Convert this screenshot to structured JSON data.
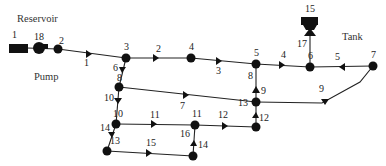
{
  "diagram": {
    "title_labels": {
      "reservoir": "Reservoir",
      "pump": "Pump",
      "tank": "Tank"
    },
    "nodes": [
      {
        "id": "1",
        "type": "reservoir",
        "x": 18,
        "y": 48,
        "label": "1",
        "lx": 12,
        "ly": 38
      },
      {
        "id": "18",
        "type": "pump",
        "x": 39,
        "y": 48,
        "label": "18",
        "lx": 34,
        "ly": 40
      },
      {
        "id": "2",
        "type": "junction",
        "x": 58,
        "y": 49,
        "label": "2",
        "lx": 59,
        "ly": 44
      },
      {
        "id": "3",
        "type": "junction",
        "x": 126,
        "y": 58,
        "label": "3",
        "lx": 124,
        "ly": 48
      },
      {
        "id": "4",
        "type": "junction",
        "x": 191,
        "y": 58,
        "label": "4",
        "lx": 189,
        "ly": 48
      },
      {
        "id": "5",
        "type": "junction",
        "x": 256,
        "y": 64,
        "label": "5",
        "lx": 254,
        "ly": 55
      },
      {
        "id": "6",
        "type": "junction",
        "x": 310,
        "y": 67,
        "label": "6",
        "lx": 308,
        "ly": 59
      },
      {
        "id": "7",
        "type": "junction",
        "x": 373,
        "y": 66,
        "label": "7",
        "lx": 371,
        "ly": 58
      },
      {
        "id": "8",
        "type": "junction",
        "x": 119,
        "y": 87,
        "label": "8",
        "lx": 116,
        "ly": 82
      },
      {
        "id": "10",
        "type": "junction",
        "x": 116,
        "y": 124,
        "label": "10",
        "lx": 113,
        "ly": 116
      },
      {
        "id": "13",
        "type": "junction",
        "x": 256,
        "y": 102,
        "label": "13",
        "lx": 238,
        "ly": 106
      },
      {
        "id": "12",
        "type": "junction",
        "x": 256,
        "y": 127,
        "label": "12",
        "lx": 258,
        "ly": 120
      },
      {
        "id": "11",
        "type": "junction",
        "x": 195,
        "y": 125,
        "label": "11",
        "lx": 192,
        "ly": 116
      },
      {
        "id": "13b",
        "type": "junction",
        "x": 107,
        "y": 151,
        "label": "13",
        "lx": 110,
        "ly": 143
      },
      {
        "id": "14",
        "type": "junction",
        "x": 193,
        "y": 156,
        "label": "",
        "lx": 0,
        "ly": 0
      },
      {
        "id": "15",
        "type": "tank",
        "x": 309,
        "y": 24,
        "label": "15",
        "lx": 305,
        "ly": 12
      }
    ],
    "links": [
      {
        "id": "1",
        "label": "1",
        "lx": 84,
        "ly": 65
      },
      {
        "id": "2",
        "label": "2",
        "lx": 156,
        "ly": 52
      },
      {
        "id": "3",
        "label": "3",
        "lx": 216,
        "ly": 74
      },
      {
        "id": "4",
        "label": "4",
        "lx": 281,
        "ly": 58
      },
      {
        "id": "5",
        "label": "5",
        "lx": 335,
        "ly": 60
      },
      {
        "id": "6",
        "label": "6",
        "lx": 114,
        "ly": 73
      },
      {
        "id": "7",
        "label": "7",
        "lx": 180,
        "ly": 108
      },
      {
        "id": "8",
        "label": "8",
        "lx": 248,
        "ly": 78
      },
      {
        "id": "9a",
        "label": "9",
        "lx": 261,
        "ly": 95
      },
      {
        "id": "9b",
        "label": "9",
        "lx": 319,
        "ly": 92
      },
      {
        "id": "10",
        "label": "10",
        "lx": 104,
        "ly": 100
      },
      {
        "id": "11",
        "label": "11",
        "lx": 150,
        "ly": 119
      },
      {
        "id": "12",
        "label": "12",
        "lx": 218,
        "ly": 119
      },
      {
        "id": "14a",
        "label": "14",
        "lx": 101,
        "ly": 130
      },
      {
        "id": "15",
        "label": "15",
        "lx": 146,
        "ly": 146
      },
      {
        "id": "16",
        "label": "16",
        "lx": 180,
        "ly": 136
      },
      {
        "id": "14b",
        "label": "14",
        "lx": 197,
        "ly": 147
      },
      {
        "id": "17",
        "label": "17",
        "lx": 298,
        "ly": 46
      }
    ]
  }
}
